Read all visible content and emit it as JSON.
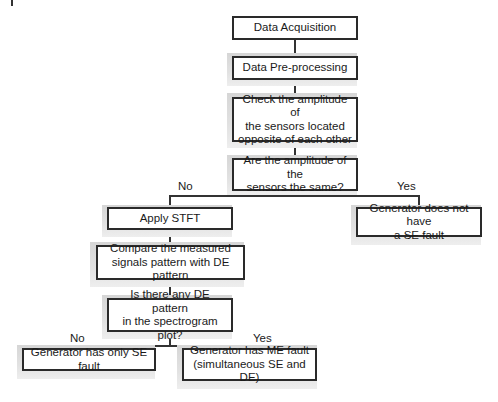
{
  "nodes": {
    "acquisition": "Data Acquisition",
    "preprocessing": "Data Pre-processing",
    "check_amplitude": [
      "Check the amplitude of",
      "the sensors located",
      "opposite of each other"
    ],
    "same_amplitude_q": [
      "Are the amplitude of the",
      "sensors the same?"
    ],
    "apply_stft": "Apply STFT",
    "no_se_fault": [
      "Generator does not have",
      "a SE fault"
    ],
    "compare_pattern": [
      "Compare the measured",
      "signals pattern with DE pattern"
    ],
    "de_pattern_q": [
      "Is there any DE pattern",
      "in the spectrogram plot?"
    ],
    "only_se_fault": "Generator has only SE fault",
    "me_fault": [
      "Generator has ME fault",
      "(simultaneous SE and DE)"
    ]
  },
  "edges": {
    "q1_no": "No",
    "q1_yes": "Yes",
    "q2_no": "No",
    "q2_yes": "Yes"
  },
  "colors": {
    "border": "#2a2a2a",
    "shadow": "#d9d9d9",
    "background": "#ffffff"
  }
}
